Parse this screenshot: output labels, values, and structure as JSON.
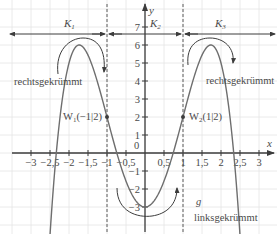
{
  "function": {
    "name": "g",
    "expression": "-x^4 + 6x^2 - 3",
    "coef": {
      "a": -1,
      "b": 6,
      "c": -3
    }
  },
  "axes": {
    "x_label": "x",
    "y_label": "y",
    "x_ticks": [
      {
        "v": -3,
        "label": "−3"
      },
      {
        "v": -2.5,
        "label": "−2,5"
      },
      {
        "v": -2,
        "label": "−2"
      },
      {
        "v": -1.5,
        "label": "−1,5"
      },
      {
        "v": -1,
        "label": "−1"
      },
      {
        "v": -0.5,
        "label": "−0,5"
      },
      {
        "v": 0.5,
        "label": "0,5"
      },
      {
        "v": 1,
        "label": "1"
      },
      {
        "v": 1.5,
        "label": "1,5"
      },
      {
        "v": 2,
        "label": "2"
      },
      {
        "v": 2.5,
        "label": "2,5"
      },
      {
        "v": 3,
        "label": "3"
      }
    ],
    "y_ticks": [
      {
        "v": 7,
        "label": "7"
      },
      {
        "v": 6,
        "label": "6"
      },
      {
        "v": 5,
        "label": "5"
      },
      {
        "v": 4,
        "label": "4"
      },
      {
        "v": 3,
        "label": "3"
      },
      {
        "v": 2,
        "label": "2"
      },
      {
        "v": 1,
        "label": "1"
      },
      {
        "v": -1,
        "label": "−1"
      },
      {
        "v": -2,
        "label": "−2"
      },
      {
        "v": -3,
        "label": "−3"
      }
    ],
    "origin_label": "0"
  },
  "intervals": [
    {
      "name": "K",
      "sub": "1"
    },
    {
      "name": "K",
      "sub": "2"
    },
    {
      "name": "K",
      "sub": "3"
    }
  ],
  "inflection_points": [
    {
      "name": "W",
      "sub": "1",
      "coords": "(−1|2)",
      "x": -1,
      "y": 2
    },
    {
      "name": "W",
      "sub": "2",
      "coords": "(1|2)",
      "x": 1,
      "y": 2
    }
  ],
  "annotations": {
    "left_curvature": "rechtsgekrümmt",
    "right_curvature": "rechtsgekrümmt",
    "middle_curvature": "linksgekrümmt",
    "graph_label": "g"
  },
  "colors": {
    "grid": "#e4e4e4",
    "axis": "#3c3c3c",
    "curve": "#6e6e6e",
    "dash": "#5a5a5a",
    "text": "#4a4a4a"
  }
}
